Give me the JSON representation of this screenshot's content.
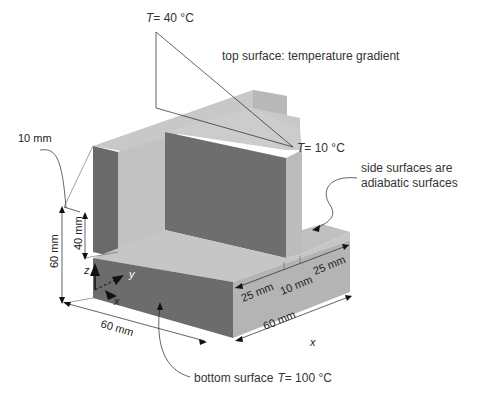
{
  "diagram": {
    "annotations": {
      "top_temp_high": {
        "var": "T",
        "value": "= 40 °C"
      },
      "top_temp_low": {
        "var": "T",
        "value": "= 10 °C"
      },
      "top_surface": "top surface: temperature gradient",
      "side_surfaces_line1": "side surfaces are",
      "side_surfaces_line2": "adiabatic surfaces",
      "bottom_surface_text": "bottom surface",
      "bottom_temp": {
        "var": "T",
        "value": "= 100 °C"
      }
    },
    "dimensions": {
      "wall_thickness": "10 mm",
      "total_height": "60 mm",
      "wall_height": "40 mm",
      "front_width": "60 mm",
      "depth_total": "60 mm",
      "depth_front": "25 mm",
      "depth_mid": "10 mm",
      "depth_back": "25 mm"
    },
    "axes": {
      "x": "x",
      "y": "y",
      "z": "z",
      "x_bottom": "x"
    },
    "colors": {
      "dark_face": "#6e6e6e",
      "light_face": "#c4c4c4",
      "mid_face": "#a8a8a8",
      "top_face": "#bdbdbd",
      "arrow": "#111111"
    }
  }
}
